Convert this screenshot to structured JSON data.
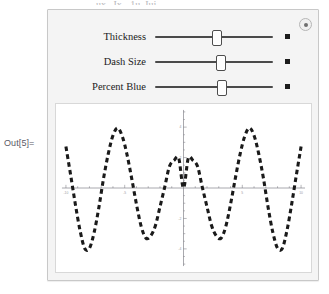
{
  "notebook": {
    "out_label": "Out[5]=",
    "top_clipped_text": "ux , Ix, -1u, Iuj"
  },
  "manipulate": {
    "toggle_icon": "control-toggle-icon",
    "controls": [
      {
        "label": "Thickness",
        "slider_position_pct": 52,
        "play_icon": "play-square-icon"
      },
      {
        "label": "Dash Size",
        "slider_position_pct": 55,
        "play_icon": "play-square-icon"
      },
      {
        "label": "Percent Blue",
        "slider_position_pct": 56,
        "play_icon": "play-square-icon"
      }
    ]
  },
  "chart_data": {
    "type": "line",
    "title": "",
    "xlabel": "",
    "ylabel": "",
    "xlim": [
      -10,
      10
    ],
    "ylim": [
      -5,
      5
    ],
    "xticks": [
      -10,
      -5,
      5,
      10
    ],
    "xtick_labels": [
      "-10",
      "-5",
      "5",
      "10"
    ],
    "yticks": [
      -4,
      -2,
      2,
      4
    ],
    "ytick_labels": [
      "-4",
      "-2",
      "2",
      "4"
    ],
    "grid": false,
    "legend": null,
    "line_style": "dashed",
    "line_color": "#1a1a1a",
    "series": [
      {
        "name": "x Sin[x] / 2",
        "x": [
          -10.0,
          -9.6,
          -9.2,
          -8.8,
          -8.4,
          -8.0,
          -7.6,
          -7.2,
          -6.8,
          -6.4,
          -6.0,
          -5.6,
          -5.2,
          -4.8,
          -4.4,
          -4.0,
          -3.6,
          -3.2,
          -2.8,
          -2.4,
          -2.0,
          -1.6,
          -1.2,
          -0.8,
          -0.4,
          0.0,
          0.4,
          0.8,
          1.2,
          1.6,
          2.0,
          2.4,
          2.8,
          3.2,
          3.6,
          4.0,
          4.4,
          4.8,
          5.2,
          5.6,
          6.0,
          6.4,
          6.8,
          7.2,
          7.6,
          8.0,
          8.4,
          8.8,
          9.2,
          9.6,
          10.0
        ],
        "y": [
          2.72,
          0.86,
          -1.06,
          -2.79,
          -3.97,
          -3.96,
          -2.92,
          -1.29,
          0.63,
          2.24,
          3.45,
          3.94,
          3.38,
          2.18,
          0.6,
          -1.07,
          -2.52,
          -3.29,
          -3.16,
          -2.5,
          -1.24,
          0.05,
          1.41,
          1.82,
          1.94,
          0.0,
          1.94,
          1.82,
          1.41,
          0.05,
          -1.24,
          -2.5,
          -3.16,
          -3.29,
          -2.52,
          -1.07,
          0.6,
          2.18,
          3.38,
          3.94,
          3.45,
          2.24,
          0.63,
          -1.29,
          -2.92,
          -3.96,
          -3.97,
          -2.79,
          -1.06,
          0.86,
          2.72
        ]
      }
    ]
  }
}
